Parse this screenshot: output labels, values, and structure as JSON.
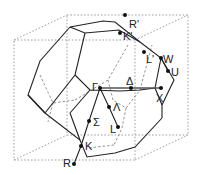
{
  "diagram": {
    "type": "brillouin-zone-fcc",
    "colors": {
      "edge": "#222222",
      "hidden": "#777777",
      "box": "#888888",
      "point": "#111111"
    },
    "points": [
      {
        "id": "R_prime",
        "label": "R'",
        "x": 125,
        "y": 15,
        "lx": 132,
        "ly": 28
      },
      {
        "id": "K_prime",
        "label": "K'",
        "x": 120,
        "y": 33,
        "lx": 124,
        "ly": 41
      },
      {
        "id": "L_prime",
        "label": "L'",
        "x": 144,
        "y": 52,
        "lx": 147,
        "ly": 63
      },
      {
        "id": "W",
        "label": "W",
        "x": 161,
        "y": 58,
        "lx": 164,
        "ly": 63
      },
      {
        "id": "U",
        "label": "U",
        "x": 168,
        "y": 71,
        "lx": 172,
        "ly": 76
      },
      {
        "id": "Gamma",
        "label": "Γ",
        "x": 100,
        "y": 88,
        "lx": 93,
        "ly": 90
      },
      {
        "id": "Delta",
        "label": "Δ",
        "x": 131,
        "y": 88,
        "lx": 127,
        "ly": 84
      },
      {
        "id": "X",
        "label": "X",
        "x": 161,
        "y": 88,
        "lx": 157,
        "ly": 102
      },
      {
        "id": "Lambda",
        "label": "Λ",
        "x": 109,
        "y": 107,
        "lx": 114,
        "ly": 112
      },
      {
        "id": "L",
        "label": "L",
        "x": 118,
        "y": 127,
        "lx": 110,
        "ly": 132
      },
      {
        "id": "Sigma",
        "label": "Σ",
        "x": 89,
        "y": 121,
        "lx": 94,
        "ly": 126
      },
      {
        "id": "K",
        "label": "K",
        "x": 81,
        "y": 146,
        "lx": 86,
        "ly": 150
      },
      {
        "id": "R",
        "label": "R",
        "x": 74,
        "y": 164,
        "lx": 63,
        "ly": 166
      }
    ]
  }
}
